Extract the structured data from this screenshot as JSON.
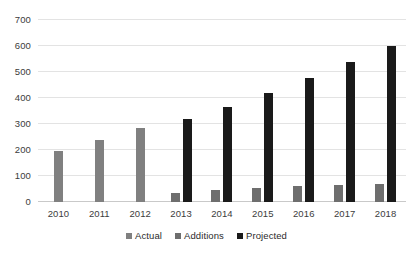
{
  "chart_data": {
    "type": "bar",
    "title": "",
    "subtitle": "",
    "xlabel": "",
    "ylabel": "",
    "categories": [
      "2010",
      "2011",
      "2012",
      "2013",
      "2014",
      "2015",
      "2016",
      "2017",
      "2018"
    ],
    "series": [
      {
        "name": "Actual",
        "color": "#808080",
        "values": [
          197,
          238,
          285,
          null,
          null,
          null,
          null,
          null,
          null
        ]
      },
      {
        "name": "Additions",
        "color": "#6e6e6e",
        "values": [
          null,
          null,
          null,
          35,
          48,
          55,
          60,
          65,
          68
        ]
      },
      {
        "name": "Projected",
        "color": "#1a1a1a",
        "values": [
          null,
          null,
          null,
          320,
          367,
          420,
          477,
          537,
          600
        ]
      }
    ],
    "ylim": [
      0,
      700
    ],
    "ytick_step": 100,
    "yticks": [
      0,
      100,
      200,
      300,
      400,
      500,
      600,
      700
    ],
    "ytick_labels": [
      "0",
      "100",
      "200",
      "300",
      "400",
      "500",
      "600",
      "700"
    ],
    "xtick_labels": [
      "2010",
      "2011",
      "2012",
      "2013",
      "2014",
      "2015",
      "2016",
      "2017",
      "2018"
    ],
    "grid": true,
    "grid_axis": "y",
    "legend": [
      "Actual",
      "Additions",
      "Projected"
    ],
    "legend_position": "bottom",
    "background_color": "#ffffff",
    "bar_grouping": "clustered"
  }
}
